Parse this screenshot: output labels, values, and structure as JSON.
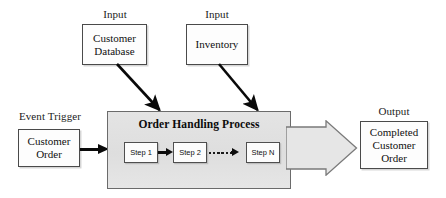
{
  "diagram": {
    "title": "Order Handling Process",
    "type": "process-flow",
    "colors": {
      "process_fill": "#e2e2e2",
      "process_border": "#6b6b6b",
      "box_fill": "#fdfdfd",
      "box_border": "#4a4a4a",
      "arrow": "#0a0a0a",
      "canvas": "#ffffff"
    },
    "captions": {
      "input_left": "Input",
      "input_right": "Input",
      "event_trigger": "Event Trigger",
      "output": "Output"
    },
    "inputs": [
      {
        "label": "Customer\nDatabase",
        "caption": "Input"
      },
      {
        "label": "Inventory",
        "caption": "Input"
      }
    ],
    "trigger": {
      "caption": "Event Trigger",
      "label": "Customer\nOrder"
    },
    "output": {
      "caption": "Output",
      "label": "Completed\nCustomer\nOrder"
    },
    "process": {
      "title": "Order Handling Process",
      "steps": [
        {
          "label": "Step 1"
        },
        {
          "label": "Step 2"
        },
        {
          "label": "Step N"
        }
      ],
      "ellipsis_dots": 6
    }
  }
}
